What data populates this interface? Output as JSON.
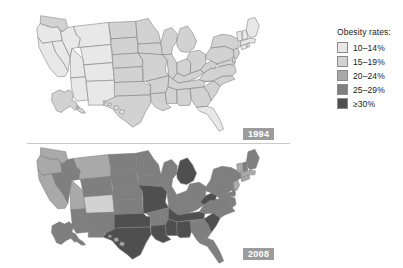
{
  "figure": {
    "background_color": "#ffffff"
  },
  "legend": {
    "title": "Obesity rates:",
    "position": "right",
    "items": [
      {
        "label": "10–14%",
        "color": "#e8e8e8",
        "min": 10,
        "max": 14
      },
      {
        "label": "15–19%",
        "color": "#d2d2d2",
        "min": 15,
        "max": 19
      },
      {
        "label": "20–24%",
        "color": "#a9a9a9",
        "min": 20,
        "max": 24
      },
      {
        "label": "25–29%",
        "color": "#7f7f7f",
        "min": 25,
        "max": 29
      },
      {
        "label": "≥30%",
        "color": "#4f4f4f",
        "min": 30,
        "max": null
      }
    ]
  },
  "panels": [
    {
      "id": "panel-1994",
      "year_label": "1994",
      "badge_color": "#9c9c9c",
      "badge_text_color": "#ffffff"
    },
    {
      "id": "panel-2008",
      "year_label": "2008",
      "badge_color": "#9c9c9c",
      "badge_text_color": "#ffffff"
    }
  ],
  "chart_data": {
    "type": "map",
    "subtype": "choropleth",
    "title": "Obesity rates",
    "legend_title": "Obesity rates:",
    "bins": [
      {
        "label": "10–14%",
        "color": "#e8e8e8"
      },
      {
        "label": "15–19%",
        "color": "#d2d2d2"
      },
      {
        "label": "20–24%",
        "color": "#a9a9a9"
      },
      {
        "label": "25–29%",
        "color": "#7f7f7f"
      },
      {
        "label": "≥30%",
        "color": "#4f4f4f"
      }
    ],
    "panels": [
      {
        "year": "1994",
        "states": {
          "WA": "15–19%",
          "OR": "10–14%",
          "CA": "10–14%",
          "NV": "10–14%",
          "ID": "10–14%",
          "MT": "10–14%",
          "WY": "10–14%",
          "UT": "10–14%",
          "AZ": "10–14%",
          "CO": "10–14%",
          "NM": "10–14%",
          "ND": "15–19%",
          "SD": "15–19%",
          "NE": "15–19%",
          "KS": "15–19%",
          "OK": "15–19%",
          "TX": "15–19%",
          "MN": "15–19%",
          "IA": "15–19%",
          "MO": "15–19%",
          "AR": "15–19%",
          "LA": "15–19%",
          "WI": "15–19%",
          "IL": "15–19%",
          "MI": "15–19%",
          "IN": "15–19%",
          "OH": "15–19%",
          "KY": "15–19%",
          "TN": "15–19%",
          "MS": "15–19%",
          "AL": "15–19%",
          "GA": "15–19%",
          "FL": "10–14%",
          "SC": "15–19%",
          "NC": "15–19%",
          "VA": "15–19%",
          "WV": "15–19%",
          "MD": "15–19%",
          "DE": "15–19%",
          "PA": "15–19%",
          "NJ": "15–19%",
          "NY": "15–19%",
          "CT": "10–14%",
          "RI": "10–14%",
          "MA": "10–14%",
          "VT": "10–14%",
          "NH": "10–14%",
          "ME": "10–14%",
          "AK": "15–19%",
          "HI": "10–14%"
        }
      },
      {
        "year": "2008",
        "states": {
          "WA": "20–24%",
          "OR": "20–24%",
          "CA": "20–24%",
          "NV": "25–29%",
          "ID": "25–29%",
          "MT": "20–24%",
          "WY": "25–29%",
          "UT": "20–24%",
          "AZ": "25–29%",
          "CO": "15–19%",
          "NM": "25–29%",
          "ND": "25–29%",
          "SD": "25–29%",
          "NE": "25–29%",
          "KS": "25–29%",
          "OK": "≥30%",
          "TX": "≥30%",
          "MN": "25–29%",
          "IA": "25–29%",
          "MO": "≥30%",
          "AR": "25–29%",
          "LA": "≥30%",
          "WI": "25–29%",
          "IL": "25–29%",
          "MI": "≥30%",
          "IN": "25–29%",
          "OH": "25–29%",
          "KY": "25–29%",
          "TN": "≥30%",
          "MS": "≥30%",
          "AL": "≥30%",
          "GA": "25–29%",
          "FL": "25–29%",
          "SC": "≥30%",
          "NC": "25–29%",
          "VA": "25–29%",
          "WV": "≥30%",
          "MD": "25–29%",
          "DE": "25–29%",
          "PA": "25–29%",
          "NJ": "20–24%",
          "NY": "25–29%",
          "CT": "20–24%",
          "RI": "20–24%",
          "MA": "20–24%",
          "VT": "20–24%",
          "NH": "25–29%",
          "ME": "25–29%",
          "AK": "25–29%",
          "HI": "20–24%"
        }
      }
    ]
  }
}
